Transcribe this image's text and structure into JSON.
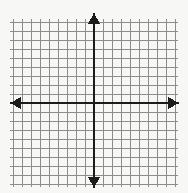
{
  "figure": {
    "name": "blank-cartesian-coordinate-grid",
    "title": "",
    "width": 188,
    "height": 193,
    "background_color": "#f7f7f5"
  },
  "chart_data": {
    "type": "scatter",
    "title": "",
    "subtitle": "",
    "xlabel": "",
    "ylabel": "",
    "x": [],
    "y": [],
    "series": [],
    "annotations": [],
    "legend": [],
    "legend_position": "none",
    "grid": true,
    "xlim": [
      -9,
      9
    ],
    "ylim": [
      -9,
      9
    ],
    "xticks": [
      -9,
      -8,
      -7,
      -6,
      -5,
      -4,
      -3,
      -2,
      -1,
      0,
      1,
      2,
      3,
      4,
      5,
      6,
      7,
      8,
      9
    ],
    "yticks": [
      -9,
      -8,
      -7,
      -6,
      -5,
      -4,
      -3,
      -2,
      -1,
      0,
      1,
      2,
      3,
      4,
      5,
      6,
      7,
      8,
      9
    ],
    "xtick_labels": [],
    "ytick_labels": []
  },
  "grid": {
    "line_color": "#8c8c8c",
    "line_width": 1,
    "cell_size": 9,
    "columns": 18,
    "rows": 18,
    "left": 13,
    "top": 22,
    "right": 175,
    "bottom": 184
  },
  "axes": {
    "color": "#1c1c1c",
    "line_width": 2,
    "origin_x": 94,
    "origin_y": 103,
    "x_axis": {
      "name": "x-axis",
      "label": "",
      "start_x": 10,
      "end_x": 179,
      "arrow_left": true,
      "arrow_right": true
    },
    "y_axis": {
      "name": "y-axis",
      "label": "",
      "start_y": 13,
      "end_y": 188,
      "arrow_up": true,
      "arrow_down": true
    },
    "arrow_half_width": 6,
    "arrow_length": 11
  }
}
